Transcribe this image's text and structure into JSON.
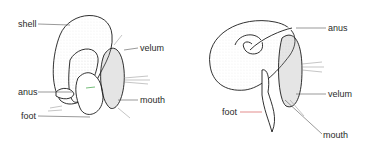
{
  "figure": {
    "left_diagram": {
      "labels": {
        "shell": "shell",
        "velum": "velum",
        "anus": "anus",
        "mouth": "mouth",
        "foot": "foot"
      }
    },
    "right_diagram": {
      "labels": {
        "anus": "anus",
        "velum": "velum",
        "foot": "foot",
        "mouth": "mouth"
      }
    },
    "colors": {
      "outline": "#1a1a1a",
      "cilia": "#8a8a8a",
      "stipple": "#cfcfcf",
      "leader": "#555555",
      "accent_red": "#d04040",
      "accent_green": "#3aa040"
    }
  }
}
